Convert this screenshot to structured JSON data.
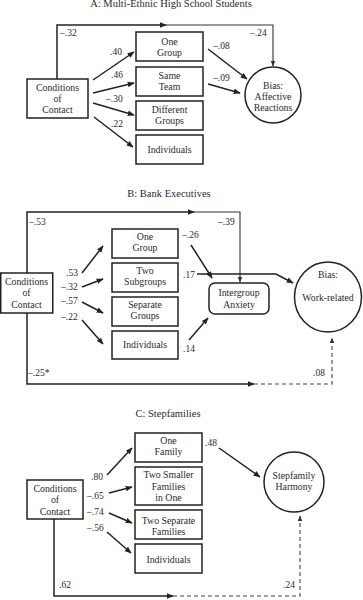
{
  "colors": {
    "line": "#222222",
    "text": "#2a2a2a",
    "background": "#ffffff"
  },
  "panel_a": {
    "title": "A: Multi-Ethnic High School Students",
    "source": [
      "Conditions",
      "of",
      "Contact"
    ],
    "mediators": [
      {
        "lines": [
          "One",
          "Group"
        ],
        "path_in": ".40",
        "path_out": "–.08"
      },
      {
        "lines": [
          "Same",
          "Team"
        ],
        "path_in": ".46",
        "path_out": "–.09"
      },
      {
        "lines": [
          "Different",
          "Groups"
        ],
        "path_in": "–.30"
      },
      {
        "lines": [
          "Individuals"
        ],
        "path_in": ".22"
      }
    ],
    "outcome": [
      "Bias:",
      "Affective",
      "Reactions"
    ],
    "direct_path": {
      "source_label": "–.32",
      "target_label": "–.24"
    }
  },
  "panel_b": {
    "title": "B: Bank Executives",
    "source": [
      "Conditions",
      "of",
      "Contact"
    ],
    "mediators": [
      {
        "lines": [
          "One",
          "Group"
        ],
        "path_in": ".53",
        "path_out": "–.26"
      },
      {
        "lines": [
          "Two",
          "Subgroups"
        ],
        "path_in": "–.32",
        "path_out": ".17"
      },
      {
        "lines": [
          "Separate",
          "Groups"
        ],
        "path_in": "–.57"
      },
      {
        "lines": [
          "Individuals"
        ],
        "path_in": "–.22",
        "path_out": ".14"
      }
    ],
    "intermediate": [
      "Intergroup",
      "Anxiety"
    ],
    "outcome": [
      "Bias:",
      "Work-related"
    ],
    "top_path": {
      "source_label": "–.53",
      "target_label": "–.39"
    },
    "bottom_path": {
      "source_label": "–.25*",
      "target_label": ".08"
    }
  },
  "panel_c": {
    "title": "C: Stepfamilies",
    "source": [
      "Conditions",
      "of",
      "Contact"
    ],
    "mediators": [
      {
        "lines": [
          "One",
          "Family"
        ],
        "path_in": ".80",
        "path_out": ".48"
      },
      {
        "lines": [
          "Two Smaller",
          "Families",
          "in One"
        ],
        "path_in": "–.65"
      },
      {
        "lines": [
          "Two Separate",
          "Families"
        ],
        "path_in": "–.74"
      },
      {
        "lines": [
          "Individuals"
        ],
        "path_in": "–.56"
      }
    ],
    "outcome": [
      "Stepfamily",
      "Harmony"
    ],
    "bottom_path": {
      "source_label": ".62",
      "target_label": ".24"
    }
  }
}
